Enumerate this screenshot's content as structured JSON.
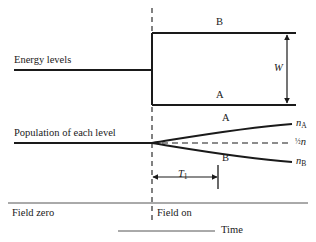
{
  "figure": {
    "type": "schematic-diagram",
    "background_color": "#ffffff",
    "line_color": "#1a1a1a",
    "thin_line_color": "#555555"
  },
  "row_labels": {
    "energy_levels": "Energy levels",
    "population": "Population of each level"
  },
  "energy_level_diagram": {
    "upper_level_label": "B",
    "lower_level_label": "A",
    "splitting_label": "W",
    "splitting_label_style": "italic",
    "degenerate_line_y": 70,
    "upper_level_y": 33,
    "lower_level_y": 105,
    "split_x": 152,
    "right_x": 296
  },
  "population_diagram": {
    "upper_curve_label": "A",
    "lower_curve_label": "B",
    "upper_curve_end_label": "n",
    "upper_curve_end_sub": "A",
    "lower_curve_end_label": "n",
    "lower_curve_end_sub": "B",
    "equilibrium_label_frac": "½",
    "equilibrium_label_var": "n",
    "baseline_y": 143,
    "split_x": 152
  },
  "relaxation_marker": {
    "label": "T",
    "label_sub": "1",
    "arrow_start_x": 152,
    "arrow_end_x": 218,
    "arrow_y": 177
  },
  "axis": {
    "field_zero_label": "Field zero",
    "field_on_label": "Field on",
    "time_label": "Time",
    "divider_y": 203,
    "time_line_y": 231
  },
  "dashed_divider": {
    "x": 152,
    "top_y": 8,
    "bottom_y": 224,
    "description": "vertical dashed line separating field-zero from field-on regions"
  }
}
